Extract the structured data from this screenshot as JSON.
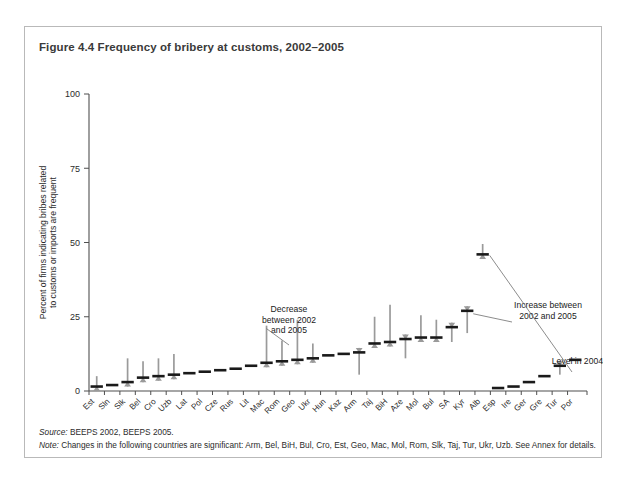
{
  "figure": {
    "title": "Figure 4.4  Frequency of bribery at customs, 2002–2005",
    "source_label": "Source:",
    "source_text": " BEEPS 2002, BEEPS 2005.",
    "note_label": "Note:",
    "note_text": " Changes in the following countries are significant: Arm, Bel, BiH, Bul, Cro, Est, Geo, Mac, Mol, Rom, Slk, Taj, Tur, Ukr, Uzb. See Annex for details."
  },
  "annotations": [
    {
      "name": "decrease-annotation",
      "lines": [
        "Decrease",
        "between 2002",
        "and 2005"
      ],
      "x": 264,
      "y": 285
    },
    {
      "name": "increase-annotation",
      "lines": [
        "Increase between",
        "2002 and 2005"
      ],
      "x": 523,
      "y": 281
    },
    {
      "name": "level-annotation",
      "lines": [
        "Level in 2004/5"
      ],
      "x": 556,
      "y": 337
    }
  ],
  "colors": {
    "decrease_arrow": "#9a9a9a",
    "increase_arrow": "#9a9a9a",
    "level_bar": "#1a1a1a",
    "axis": "#4f4f4f",
    "frame": "#b9b9b9",
    "title": "#3a3a3a"
  },
  "chart_data": {
    "type": "bar",
    "title": "Frequency of bribery at customs, 2002–2005",
    "xlabel": "",
    "ylabel": "Percent of firms indicating bribes related to customs or imports are frequent",
    "ylim": [
      0,
      100
    ],
    "yticks": [
      0,
      25,
      50,
      75,
      100
    ],
    "grid": false,
    "legend": [
      "Decrease between 2002 and 2005",
      "Increase between 2002 and 2005",
      "Level in 2004/5"
    ],
    "categories": [
      "Est",
      "Sln",
      "Slk",
      "Bel",
      "Cro",
      "Uzb",
      "Lat",
      "Pol",
      "Cze",
      "Rus",
      "Lit",
      "Mac",
      "Rom",
      "Geo",
      "Ukr",
      "Hun",
      "Kaz",
      "Arm",
      "Taj",
      "BiH",
      "Aze",
      "Mol",
      "Bul",
      "SA",
      "Kyr",
      "Alb",
      "Esp",
      "Ire",
      "Ger",
      "Gre",
      "Tur",
      "Por"
    ],
    "series": [
      {
        "name": "Level in 2004/5",
        "values": [
          1.5,
          2.0,
          3.0,
          4.5,
          5.0,
          5.5,
          6.0,
          6.5,
          7.0,
          7.5,
          8.5,
          9.5,
          10.0,
          10.5,
          11.0,
          12.0,
          12.5,
          13.0,
          16.0,
          16.5,
          17.5,
          18.0,
          18.0,
          21.5,
          27.0,
          46.0,
          1.0,
          1.5,
          3.0,
          5.0,
          8.5,
          10.5
        ]
      },
      {
        "name": "Value in 2002",
        "values": [
          5.0,
          2.0,
          11.0,
          10.0,
          11.0,
          12.5,
          6.0,
          6.5,
          7.0,
          6.5,
          8.5,
          22.0,
          17.0,
          24.0,
          16.0,
          12.0,
          12.5,
          9.0,
          25.0,
          29.0,
          14.5,
          25.5,
          24.0,
          19.0,
          24.0,
          46.0,
          1.0,
          1.5,
          3.0,
          5.0,
          6.0,
          10.5
        ]
      }
    ],
    "markers": [
      {
        "cat": "Est",
        "level": 1.5,
        "from": 5.0,
        "dir": "down"
      },
      {
        "cat": "Sln",
        "level": 2.0,
        "from": 2.0,
        "dir": "none"
      },
      {
        "cat": "Slk",
        "level": 3.0,
        "from": 11.0,
        "dir": "down"
      },
      {
        "cat": "Bel",
        "level": 4.5,
        "from": 10.0,
        "dir": "down"
      },
      {
        "cat": "Cro",
        "level": 5.0,
        "from": 11.0,
        "dir": "down"
      },
      {
        "cat": "Uzb",
        "level": 5.5,
        "from": 12.5,
        "dir": "down"
      },
      {
        "cat": "Lat",
        "level": 6.0,
        "from": 6.0,
        "dir": "none"
      },
      {
        "cat": "Pol",
        "level": 6.5,
        "from": 6.5,
        "dir": "none"
      },
      {
        "cat": "Cze",
        "level": 7.0,
        "from": 7.0,
        "dir": "none"
      },
      {
        "cat": "Rus",
        "level": 7.5,
        "from": 6.0,
        "dir": "up"
      },
      {
        "cat": "Lit",
        "level": 8.5,
        "from": 8.5,
        "dir": "none"
      },
      {
        "cat": "Mac",
        "level": 9.5,
        "from": 22.0,
        "dir": "down"
      },
      {
        "cat": "Rom",
        "level": 10.0,
        "from": 17.0,
        "dir": "down"
      },
      {
        "cat": "Geo",
        "level": 10.5,
        "from": 24.0,
        "dir": "down"
      },
      {
        "cat": "Ukr",
        "level": 11.0,
        "from": 16.0,
        "dir": "down"
      },
      {
        "cat": "Hun",
        "level": 12.0,
        "from": 12.0,
        "dir": "none"
      },
      {
        "cat": "Kaz",
        "level": 12.5,
        "from": 12.5,
        "dir": "none"
      },
      {
        "cat": "Arm",
        "level": 13.0,
        "from": 5.5,
        "dir": "up"
      },
      {
        "cat": "Taj",
        "level": 16.0,
        "from": 25.0,
        "dir": "down"
      },
      {
        "cat": "BiH",
        "level": 16.5,
        "from": 29.0,
        "dir": "down"
      },
      {
        "cat": "Aze",
        "level": 17.5,
        "from": 11.0,
        "dir": "up"
      },
      {
        "cat": "Mol",
        "level": 18.0,
        "from": 25.5,
        "dir": "down"
      },
      {
        "cat": "Bul",
        "level": 18.0,
        "from": 24.0,
        "dir": "down"
      },
      {
        "cat": "SA",
        "level": 21.5,
        "from": 16.5,
        "dir": "up"
      },
      {
        "cat": "Kyr",
        "level": 27.0,
        "from": 19.5,
        "dir": "up"
      },
      {
        "cat": "Alb",
        "level": 46.0,
        "from": 49.5,
        "dir": "down"
      },
      {
        "cat": "Esp",
        "level": 1.0,
        "from": 1.0,
        "dir": "none"
      },
      {
        "cat": "Ire",
        "level": 1.5,
        "from": 1.5,
        "dir": "none"
      },
      {
        "cat": "Ger",
        "level": 3.0,
        "from": 3.0,
        "dir": "none"
      },
      {
        "cat": "Gre",
        "level": 5.0,
        "from": 5.0,
        "dir": "none"
      },
      {
        "cat": "Tur",
        "level": 8.5,
        "from": 5.5,
        "dir": "up"
      },
      {
        "cat": "Por",
        "level": 10.5,
        "from": 10.5,
        "dir": "none"
      }
    ]
  }
}
